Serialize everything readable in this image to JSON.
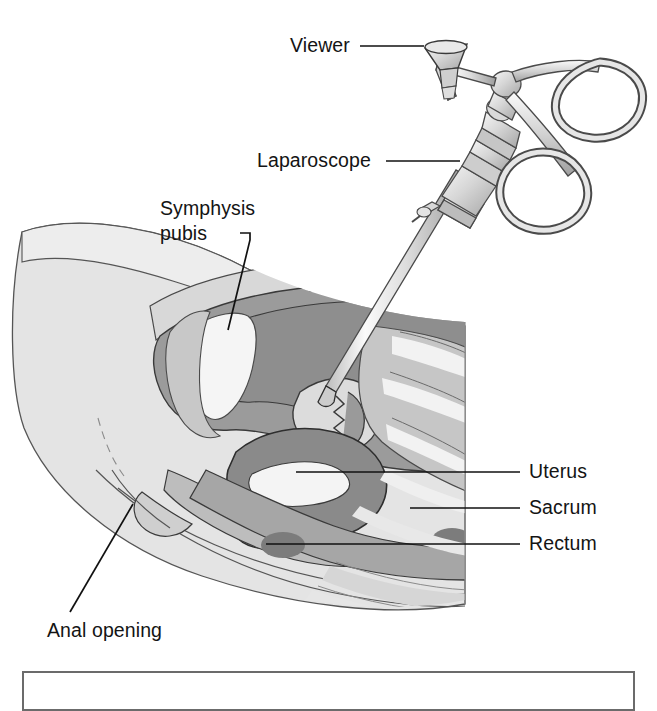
{
  "figure": {
    "type": "medical-illustration",
    "palette": {
      "background": "#ffffff",
      "label_text": "#141414",
      "leader_line": "#111111",
      "outline": "#3a3a3a",
      "skin_light": "#e2e2e2",
      "thigh_gray": "#dcdcdc",
      "abdomen_wall": "#d2d2d2",
      "cavity_mid_gray": "#9e9e9e",
      "organ_dark_gray": "#8a8a8a",
      "bone_white": "#f4f4f4",
      "sacrum_gray": "#c4c4c4",
      "rectum_gray": "#a8a8a8",
      "dark_patch": "#7a7a7a",
      "instrument_light": "#efefef",
      "instrument_shade": "#b9b9b9",
      "instrument_stroke": "#4a4a4a",
      "caption_border": "#6b6b6b"
    },
    "labels": [
      {
        "id": "viewer",
        "text": "Viewer",
        "x": 290,
        "y": 52
      },
      {
        "id": "laparoscope",
        "text": "Laparoscope",
        "x": 257,
        "y": 167
      },
      {
        "id": "symphysis",
        "line1": "Symphysis",
        "line2": "pubis",
        "x": 160,
        "y": 215
      },
      {
        "id": "uterus",
        "text": "Uterus",
        "x": 529,
        "y": 478
      },
      {
        "id": "sacrum",
        "text": "Sacrum",
        "x": 529,
        "y": 514
      },
      {
        "id": "rectum",
        "text": "Rectum",
        "x": 529,
        "y": 550
      },
      {
        "id": "anal-opening",
        "text": "Anal opening",
        "x": 47,
        "y": 637
      }
    ],
    "structures": [
      "Viewer (eyepiece)",
      "Laparoscope shaft",
      "Symphysis pubis",
      "Uterus",
      "Sacrum",
      "Rectum",
      "Anal opening"
    ]
  }
}
